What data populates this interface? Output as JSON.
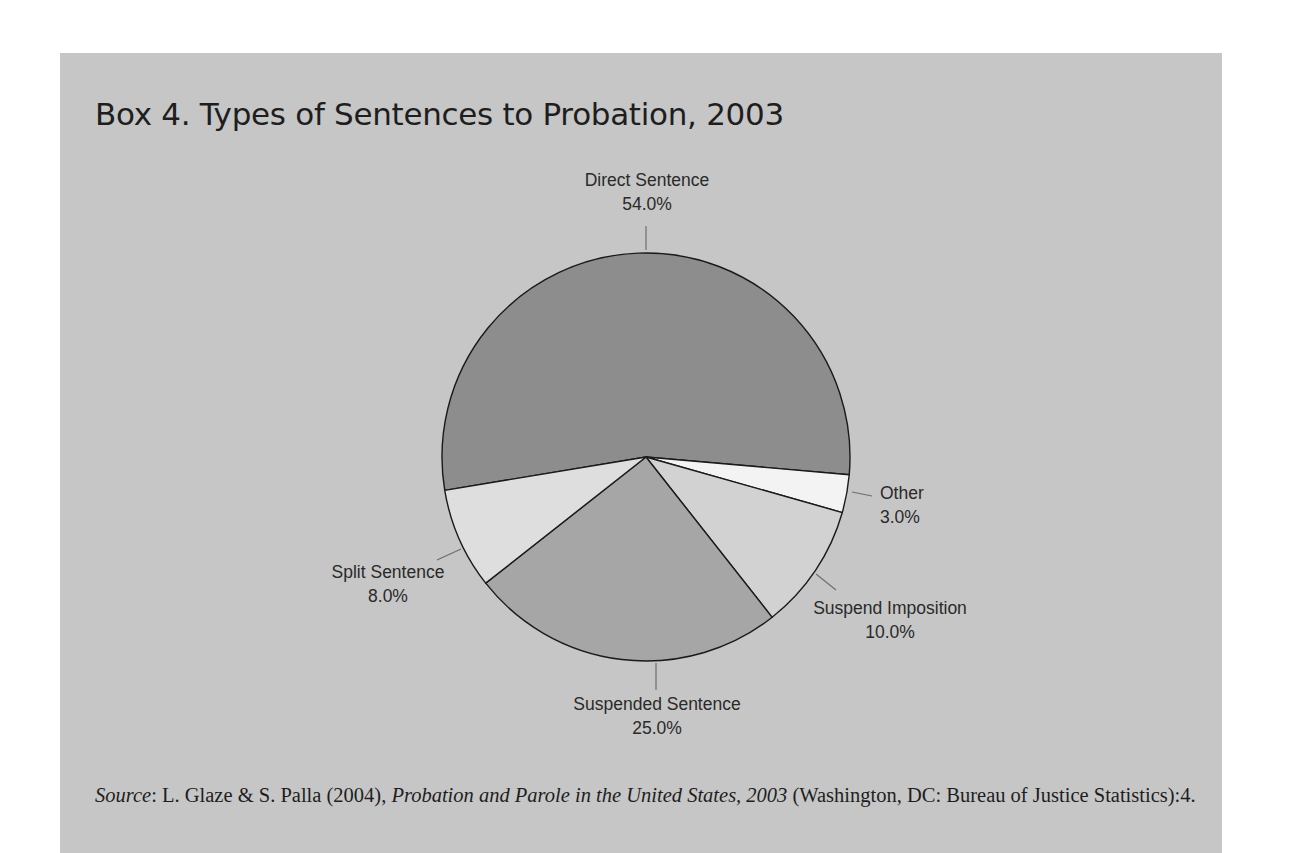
{
  "title": "Box 4. Types of Sentences to Probation, 2003",
  "source": {
    "label": "Source",
    "authors": ": L. Glaze & S. Palla (2004), ",
    "work": "Probation and Parole in the United States, 2003",
    "rest": " (Washington, DC: Bureau of Justice Statistics):4."
  },
  "colors": {
    "background": "#c6c6c6",
    "direct": "#8d8d8d",
    "other": "#f3f3f3",
    "suspend_imposition": "#d2d2d2",
    "suspended": "#a6a6a6",
    "split": "#dedede"
  },
  "chart_data": {
    "type": "pie",
    "title": "Box 4. Types of Sentences to Probation, 2003",
    "categories": [
      "Direct Sentence",
      "Other",
      "Suspend Imposition",
      "Suspended Sentence",
      "Split Sentence"
    ],
    "values": [
      54.0,
      3.0,
      10.0,
      25.0,
      8.0
    ],
    "labels": [
      "54.0%",
      "3.0%",
      "10.0%",
      "25.0%",
      "8.0%"
    ],
    "unit": "%",
    "legend": "none (direct labels with leader lines)"
  }
}
